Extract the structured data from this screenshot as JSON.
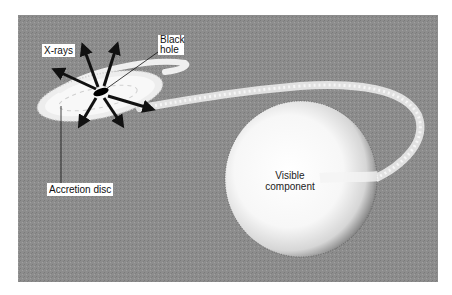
{
  "figure": {
    "colors": {
      "background_panel": "#8c8c8c",
      "page": "#ffffff",
      "disc": "#f2f2f2",
      "star": "#fbfbfb",
      "arrows": "#111111",
      "black_hole": "#000000"
    }
  },
  "labels": {
    "xrays": "X-rays",
    "black_hole_line1": "Black",
    "black_hole_line2": "hole",
    "accretion_disc": "Accretion disc",
    "visible_line1": "Visible",
    "visible_line2": "component"
  }
}
